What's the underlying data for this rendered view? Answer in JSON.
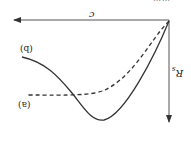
{
  "figure": {
    "orientation": "rotated-180",
    "caption_partial": "……",
    "axes": {
      "x_label": "c",
      "y_label": "R",
      "y_label_sub": "s",
      "origin_px": [
        169,
        20
      ],
      "x_arrow_end_px": [
        13,
        20
      ],
      "y_arrow_end_px": [
        169,
        123
      ],
      "line_color": "#555555"
    },
    "curves": [
      {
        "id": "a",
        "label": "(a)",
        "style": "dashed",
        "color": "#333333",
        "path": "M169,21 C150,40 135,75 105,90 C90,96 70,95 27,95"
      },
      {
        "id": "b",
        "label": "(b)",
        "style": "solid",
        "color": "#333333",
        "path": "M169,21 C155,55 125,115 104,120 C92,122 84,108 72,93 C58,76 45,62 22,57"
      }
    ]
  }
}
